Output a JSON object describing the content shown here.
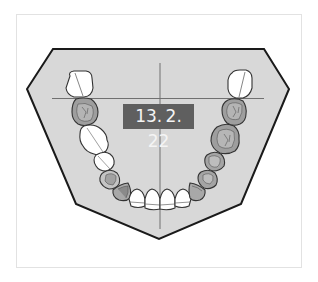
{
  "diagram": {
    "type": "dental-arch-occlusal-view",
    "jaw": "mandible",
    "date_label": "13. 2. 22",
    "footer_caption": "",
    "colors": {
      "background": "#ffffff",
      "frame_border": "#e2e2e2",
      "jaw_fill": "#d8d8d8",
      "jaw_outline": "#1a1a1a",
      "crosshair": "#707070",
      "label_bg": "#5f5f5f",
      "label_text": "#f4f4f4",
      "tooth_white": "#ffffff",
      "tooth_shaded": "#9e9e9e",
      "tooth_outline": "#3a3a3a"
    },
    "teeth": {
      "left": [
        {
          "position": "third-molar",
          "state": "white"
        },
        {
          "position": "second-molar",
          "state": "shaded"
        },
        {
          "position": "first-molar",
          "state": "white"
        },
        {
          "position": "second-premolar",
          "state": "white"
        },
        {
          "position": "first-premolar",
          "state": "shaded-outline"
        },
        {
          "position": "canine",
          "state": "shaded"
        },
        {
          "position": "lateral-incisor",
          "state": "white"
        },
        {
          "position": "central-incisor",
          "state": "white"
        }
      ],
      "right": [
        {
          "position": "third-molar",
          "state": "white"
        },
        {
          "position": "second-molar",
          "state": "shaded"
        },
        {
          "position": "first-molar",
          "state": "shaded"
        },
        {
          "position": "second-premolar",
          "state": "shaded"
        },
        {
          "position": "first-premolar",
          "state": "shaded"
        },
        {
          "position": "canine",
          "state": "shaded"
        },
        {
          "position": "lateral-incisor",
          "state": "white"
        },
        {
          "position": "central-incisor",
          "state": "white"
        }
      ]
    }
  }
}
